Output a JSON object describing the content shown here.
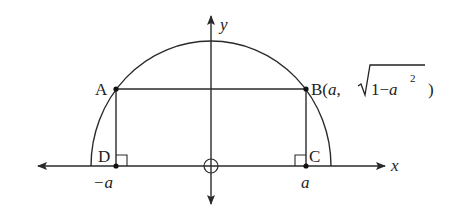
{
  "diagram": {
    "axes": {
      "x_label": "x",
      "y_label": "y",
      "origin_marker": "circle"
    },
    "points": {
      "A": {
        "label": "A"
      },
      "B": {
        "label": "B",
        "coord_prefix": "(",
        "coord_x": "a",
        "coord_sep": ",",
        "sqrt_one": "1",
        "minus": "−",
        "sqrt_var": "a",
        "exponent": "2",
        "coord_suffix": ")"
      },
      "C": {
        "label": "C"
      },
      "D": {
        "label": "D"
      }
    },
    "tick_labels": {
      "neg_a": "−a",
      "pos_a": "a"
    },
    "colors": {
      "stroke": "#2a2a2a",
      "background": "#ffffff"
    }
  }
}
